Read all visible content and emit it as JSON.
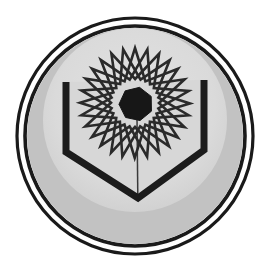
{
  "artwork": {
    "kind": "emblem",
    "title": "Atomic shield emblem",
    "description": "Circular grey medallion with a double outline ring, containing a downward-pointing shield outlined in black and an overlapping multi-pointed star / atom orbit motif with a dark heptagonal nucleus at its center.",
    "background_color": "#ffffff"
  },
  "colors": {
    "page_background": "#ffffff",
    "ring_stroke": "#1a1a1a",
    "ring_gap": "#fdfdfd",
    "disc_fill": "#c2c2c2",
    "inner_field_fill": "#dcdcdc",
    "shield_stroke": "#1c1c1c",
    "shield_fill": "#d7d7d7",
    "orbit_stroke": "#2a2a2a",
    "nucleus_fill": "#171717",
    "center_seam": "#3a3a3a"
  },
  "geometry": {
    "canvas_width": 266,
    "canvas_height": 274,
    "center_x": 135,
    "center_y": 136,
    "outer_ring_radius": 118,
    "outer_ring_width": 3.2,
    "inner_ring_radius": 110,
    "inner_ring_width": 3.6,
    "disc_radius": 108,
    "inner_field_radius": 92
  },
  "shield": {
    "name": "chevron-shield",
    "stroke_width": 7,
    "left_top_x": 66,
    "left_top_y": 82,
    "right_top_x": 204,
    "right_top_y": 80,
    "left_shoulder_y": 152,
    "right_shoulder_y": 150,
    "apex_x": 138,
    "apex_y": 198,
    "seam_top_y": 118,
    "seam_bottom_y": 196
  },
  "orbit_motif": {
    "name": "atom-orbit-star",
    "center_x": 135,
    "center_y": 103,
    "outer_radius": 55,
    "inner_radius": 24,
    "points": 7,
    "ring_count": 4,
    "rotation_step_deg": 13,
    "stroke_width": 2.6
  },
  "nucleus": {
    "name": "nucleus-heptagon",
    "center_x": 136,
    "center_y": 104,
    "radius": 17,
    "sides": 7,
    "rotation_deg": 12
  }
}
